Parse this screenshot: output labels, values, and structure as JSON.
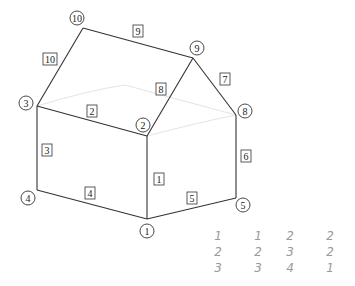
{
  "diagram": {
    "title": "",
    "nodes": [
      {
        "id": "1",
        "x": 147,
        "y": 219,
        "lx": 147,
        "ly": 231
      },
      {
        "id": "2",
        "x": 147,
        "y": 136,
        "lx": 143,
        "ly": 125
      },
      {
        "id": "3",
        "x": 37,
        "y": 106,
        "lx": 26,
        "ly": 103
      },
      {
        "id": "4",
        "x": 37,
        "y": 190,
        "lx": 28,
        "ly": 198
      },
      {
        "id": "5",
        "x": 236,
        "y": 198,
        "lx": 243,
        "ly": 205
      },
      {
        "id": "8",
        "x": 236,
        "y": 115,
        "lx": 245,
        "ly": 111
      },
      {
        "id": "9",
        "x": 193,
        "y": 58,
        "lx": 197,
        "ly": 48
      },
      {
        "id": "10",
        "x": 83,
        "y": 28,
        "lx": 77,
        "ly": 18
      }
    ],
    "edges": [
      {
        "id": "1",
        "from": "1",
        "to": "2",
        "lx": 159,
        "ly": 179
      },
      {
        "id": "2",
        "from": "3",
        "to": "2",
        "lx": 92,
        "ly": 111
      },
      {
        "id": "3",
        "from": "3",
        "to": "4",
        "lx": 47,
        "ly": 150
      },
      {
        "id": "4",
        "from": "4",
        "to": "1",
        "lx": 90,
        "ly": 193
      },
      {
        "id": "5",
        "from": "1",
        "to": "5",
        "lx": 192,
        "ly": 198
      },
      {
        "id": "6",
        "from": "5",
        "to": "8",
        "lx": 246,
        "ly": 156
      },
      {
        "id": "7",
        "from": "9",
        "to": "8",
        "lx": 225,
        "ly": 79
      },
      {
        "id": "8",
        "from": "2",
        "to": "9",
        "lx": 161,
        "ly": 89
      },
      {
        "id": "9",
        "from": "10",
        "to": "9",
        "lx": 138,
        "ly": 31
      },
      {
        "id": "10",
        "from": "3",
        "to": "10",
        "lx": 50,
        "ly": 59
      }
    ],
    "handwritten_table": [
      [
        "1",
        "1",
        "2",
        "2"
      ],
      [
        "2",
        "2",
        "3",
        "2"
      ],
      [
        "3",
        "3",
        "4",
        "1"
      ]
    ]
  }
}
